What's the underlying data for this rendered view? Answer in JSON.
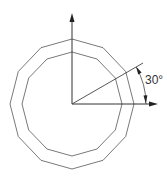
{
  "diagram": {
    "type": "geometry",
    "shapes": {
      "outer_polygon": {
        "sides": 12
      },
      "inner_polygon": {
        "sides": 12
      }
    },
    "angle": {
      "value": 30,
      "label": "30°"
    },
    "colors": {
      "polygon_stroke": "#6a6a6a",
      "axis_stroke": "#333333",
      "background": "#ffffff"
    }
  }
}
